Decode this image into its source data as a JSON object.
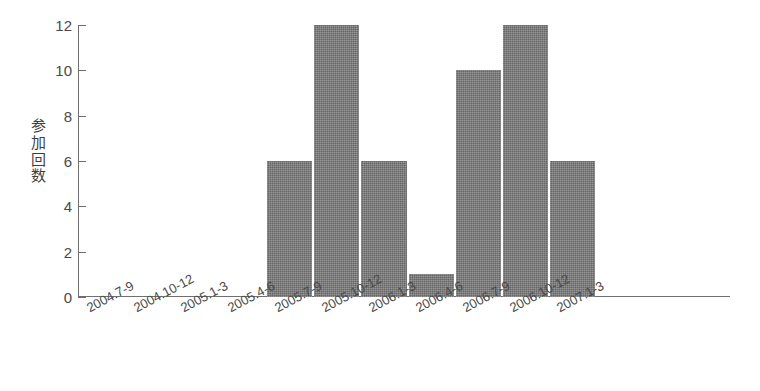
{
  "chart_data": {
    "type": "bar",
    "title": "",
    "xlabel": "",
    "ylabel": "参加回数",
    "ylabel_chars": [
      "参",
      "加",
      "回",
      "数"
    ],
    "categories": [
      "2004.7-9",
      "2004.10-12",
      "2005.1-3",
      "2005.4-6",
      "2005.7-9",
      "2005.10-12",
      "2006.1-3",
      "2006.4-6",
      "2006.7-9",
      "2006.10-12",
      "2007.1-3"
    ],
    "values": [
      0,
      0,
      0,
      0,
      6,
      12,
      6,
      1,
      10,
      12,
      6
    ],
    "ylim": [
      0,
      12
    ],
    "ytick_labels": [
      "0",
      "2",
      "4",
      "6",
      "8",
      "10",
      "12"
    ],
    "ytick_values": [
      0,
      2,
      4,
      6,
      8,
      10,
      12
    ],
    "grid": false,
    "legend": "none",
    "bar_color": "#717171",
    "axis_color": "#6f6f6f",
    "text_color": "#4a4a4a"
  }
}
